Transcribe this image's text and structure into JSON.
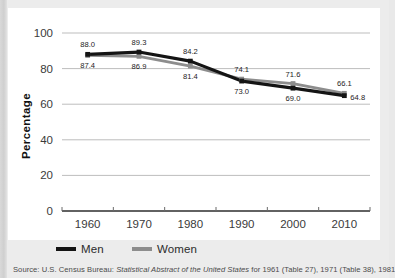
{
  "chart_data": {
    "type": "line",
    "title": "",
    "xlabel": "",
    "ylabel": "Percentage",
    "categories": [
      "1960",
      "1970",
      "1980",
      "1990",
      "2000",
      "2010"
    ],
    "x": [
      1960,
      1970,
      1980,
      1990,
      2000,
      2010
    ],
    "xlim": [
      1955,
      2015
    ],
    "ylim": [
      0,
      100
    ],
    "yticks": [
      "0",
      "20",
      "40",
      "60",
      "80",
      "100"
    ],
    "grid": true,
    "legend_position": "bottom",
    "series": [
      {
        "name": "Men",
        "color": "#141414",
        "values": [
          88.0,
          89.3,
          84.2,
          73.0,
          69.0,
          64.8
        ],
        "labels": [
          "88.0",
          "89.3",
          "84.2",
          "73.0",
          "69.0",
          "64.8"
        ],
        "label_side": [
          "above",
          "above",
          "above",
          "below",
          "below",
          "right"
        ]
      },
      {
        "name": "Women",
        "color": "#8d8d8d",
        "values": [
          87.4,
          86.9,
          81.4,
          74.1,
          71.6,
          66.1
        ],
        "labels": [
          "87.4",
          "86.9",
          "81.4",
          "74.1",
          "71.6",
          "66.1"
        ],
        "label_side": [
          "below",
          "below",
          "below",
          "above",
          "above",
          "above"
        ]
      }
    ]
  },
  "legend": {
    "men_label": "Men",
    "women_label": "Women"
  },
  "source": {
    "prefix": "Source: U.S. Census Bureau: ",
    "italic_title": "Statistical Abstract of the United States",
    "suffix": " for 1961 (Table 27), 1971 (Table 38), 1981"
  }
}
